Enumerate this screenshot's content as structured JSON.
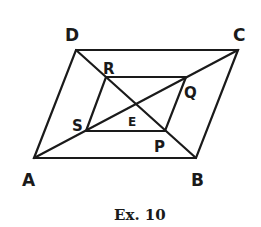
{
  "figure": {
    "caption": "Ex. 10",
    "points": {
      "A": {
        "label": "A",
        "x": 34,
        "y": 158
      },
      "B": {
        "label": "B",
        "x": 196,
        "y": 158
      },
      "C": {
        "label": "C",
        "x": 238,
        "y": 50
      },
      "D": {
        "label": "D",
        "x": 76,
        "y": 50
      },
      "R": {
        "label": "R",
        "x": 106,
        "y": 77
      },
      "Q": {
        "label": "Q",
        "x": 186,
        "y": 77
      },
      "S": {
        "label": "S",
        "x": 86,
        "y": 131
      },
      "P": {
        "label": "P",
        "x": 165,
        "y": 131
      },
      "E": {
        "label": "E",
        "x": 138,
        "y": 104
      }
    },
    "segments": [
      [
        "A",
        "B"
      ],
      [
        "B",
        "C"
      ],
      [
        "C",
        "D"
      ],
      [
        "D",
        "A"
      ],
      [
        "A",
        "C"
      ],
      [
        "D",
        "B"
      ],
      [
        "R",
        "Q"
      ],
      [
        "Q",
        "P"
      ],
      [
        "P",
        "S"
      ],
      [
        "S",
        "R"
      ]
    ],
    "stroke_color": "#1a1a1a"
  }
}
